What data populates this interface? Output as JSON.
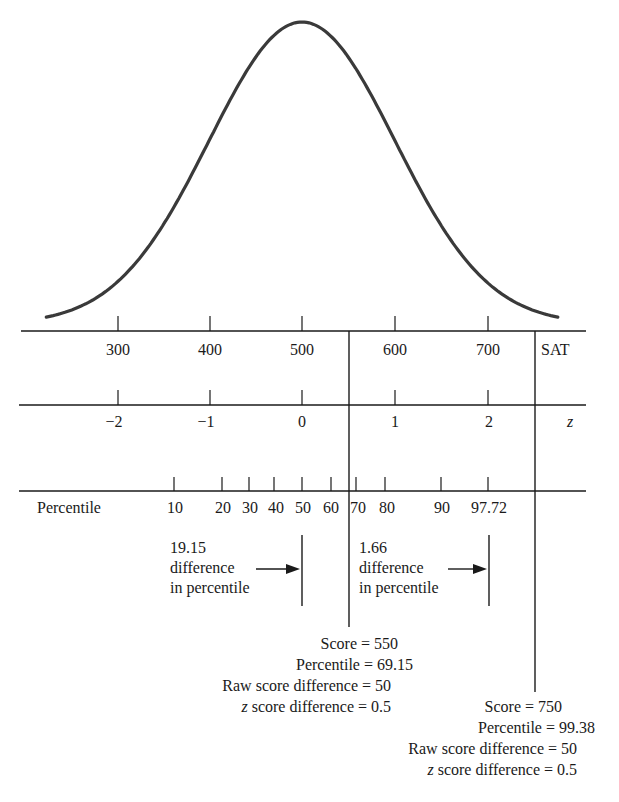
{
  "chart_data": {
    "type": "line",
    "title": "",
    "curve": {
      "mean_sat": 500,
      "sd_sat": 100,
      "z_range": [
        -2.75,
        2.75
      ]
    },
    "axes": [
      {
        "name": "SAT",
        "label": "SAT",
        "ticks": [
          300,
          400,
          500,
          600,
          700
        ]
      },
      {
        "name": "z",
        "label": "z",
        "ticks": [
          "−2",
          "−1",
          "0",
          "1",
          "2"
        ]
      },
      {
        "name": "Percentile",
        "label": "Percentile",
        "ticks": [
          "10",
          "20",
          "30",
          "40",
          "50",
          "60",
          "70",
          "80",
          "90",
          "97.72"
        ]
      }
    ],
    "markers": [
      {
        "score": 550,
        "percentile": 69.15,
        "raw_score_difference": 50,
        "z_score_difference": 0.5
      },
      {
        "score": 750,
        "percentile": 99.38,
        "raw_score_difference": 50,
        "z_score_difference": 0.5
      }
    ],
    "annotations": [
      {
        "value": "19.15",
        "text": "difference in percentile",
        "between": [
          50,
          69.15
        ]
      },
      {
        "value": "1.66",
        "text": "difference in percentile",
        "between": [
          97.72,
          99.38
        ]
      }
    ],
    "grid": false,
    "legend": null
  },
  "sat_axis": {
    "label": "SAT",
    "ticks": [
      "300",
      "400",
      "500",
      "600",
      "700"
    ]
  },
  "z_axis": {
    "label": "z",
    "ticks": [
      "−2",
      "−1",
      "0",
      "1",
      "2"
    ]
  },
  "percentile_axis": {
    "label": "Percentile",
    "ticks": [
      "10",
      "20",
      "30",
      "40",
      "50",
      "60",
      "70",
      "80",
      "90",
      "97.72"
    ]
  },
  "annotations": {
    "left": {
      "value": "19.15",
      "line1": "difference",
      "line2": "in percentile"
    },
    "right": {
      "value": "1.66",
      "line1": "difference",
      "line2": "in percentile"
    }
  },
  "marker_550": {
    "score": "Score = 550",
    "percentile": "Percentile = 69.15",
    "raw_diff": "Raw score difference = 50",
    "z_prefix": "z",
    "z_diff": " score difference = 0.5"
  },
  "marker_750": {
    "score": "Score = 750",
    "percentile": "Percentile = 99.38",
    "raw_diff": "Raw score difference = 50",
    "z_prefix": "z",
    "z_diff": " score difference = 0.5"
  }
}
